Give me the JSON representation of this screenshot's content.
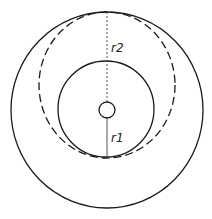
{
  "diagram": {
    "labels": {
      "r1": "r1",
      "r2": "r2"
    },
    "colors": {
      "stroke": "#1a1a1a",
      "radius_line": "#555555",
      "background": "#ffffff"
    },
    "shapes": {
      "outer_circle": {
        "cx": 107,
        "cy": 110,
        "rx": 96,
        "ry": 98
      },
      "dashed_circle": {
        "cx": 107,
        "cy": 85,
        "rx": 68,
        "ry": 73
      },
      "middle_circle": {
        "cx": 106,
        "cy": 109,
        "r": 48
      },
      "center_circle": {
        "cx": 107,
        "cy": 110,
        "r": 8
      }
    }
  }
}
